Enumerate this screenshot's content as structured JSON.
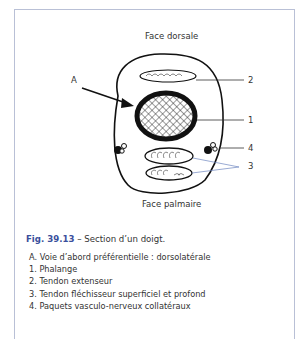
{
  "diagram": {
    "title_top": "Face dorsale",
    "title_bottom": "Face palmaire",
    "labels": {
      "A": "A",
      "n1": "1",
      "n2": "2",
      "n3": "3",
      "n4": "4"
    },
    "structures": [
      {
        "id": "1",
        "name": "phalange"
      },
      {
        "id": "2",
        "name": "tendon-extenseur"
      },
      {
        "id": "3",
        "name": "tendons-flechisseurs"
      },
      {
        "id": "4",
        "name": "paquets-vasculo-nerveux"
      }
    ],
    "colors": {
      "frame": "#b9c0d6",
      "fig_label": "#3a4f9c",
      "leader_line_3": "#6f86c0"
    }
  },
  "caption": {
    "fig_label": "Fig. 39.13",
    "text": " – Section d’un doigt."
  },
  "legend": [
    "A. Voie d’abord préférentielle : dorsolatérale",
    "1. Phalange",
    "2. Tendon extenseur",
    "3. Tendon fléchisseur superficiel et profond",
    "4. Paquets vasculo-nerveux collatéraux"
  ]
}
